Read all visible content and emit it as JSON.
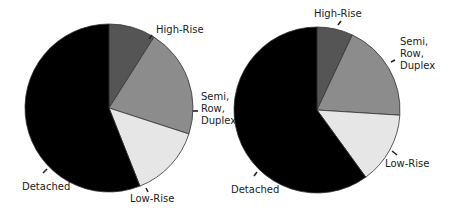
{
  "chart_data": [
    {
      "type": "pie",
      "title": "",
      "start_angle_deg": 0,
      "direction": "clockwise",
      "center": [
        109,
        108
      ],
      "radius": 84,
      "slices": [
        {
          "label": "High-Rise",
          "value": 9,
          "color": "#555555"
        },
        {
          "label": "Semi, Row, Duplex",
          "value": 21,
          "color": "#8c8c8c"
        },
        {
          "label": "Low-Rise",
          "value": 14,
          "color": "#e6e6e6"
        },
        {
          "label": "Detached",
          "value": 56,
          "color": "#000000"
        }
      ]
    },
    {
      "type": "pie",
      "title": "",
      "start_angle_deg": 0,
      "direction": "clockwise",
      "center": [
        317,
        110
      ],
      "radius": 83,
      "slices": [
        {
          "label": "High-Rise",
          "value": 7,
          "color": "#555555"
        },
        {
          "label": "Semi, Row, Duplex",
          "value": 19,
          "color": "#8c8c8c"
        },
        {
          "label": "Low-Rise",
          "value": 14,
          "color": "#e6e6e6"
        },
        {
          "label": "Detached",
          "value": 60,
          "color": "#000000"
        }
      ]
    }
  ],
  "labels": {
    "left": {
      "high_rise": "High-Rise",
      "semi_lines": [
        "Semi,",
        "Row,",
        "Duplex"
      ],
      "low_rise": "Low-Rise",
      "detached": "Detached"
    },
    "right": {
      "high_rise": "High-Rise",
      "semi_lines": [
        "Semi,",
        "Row,",
        "Duplex"
      ],
      "low_rise": "Low-Rise",
      "detached": "Detached"
    }
  }
}
